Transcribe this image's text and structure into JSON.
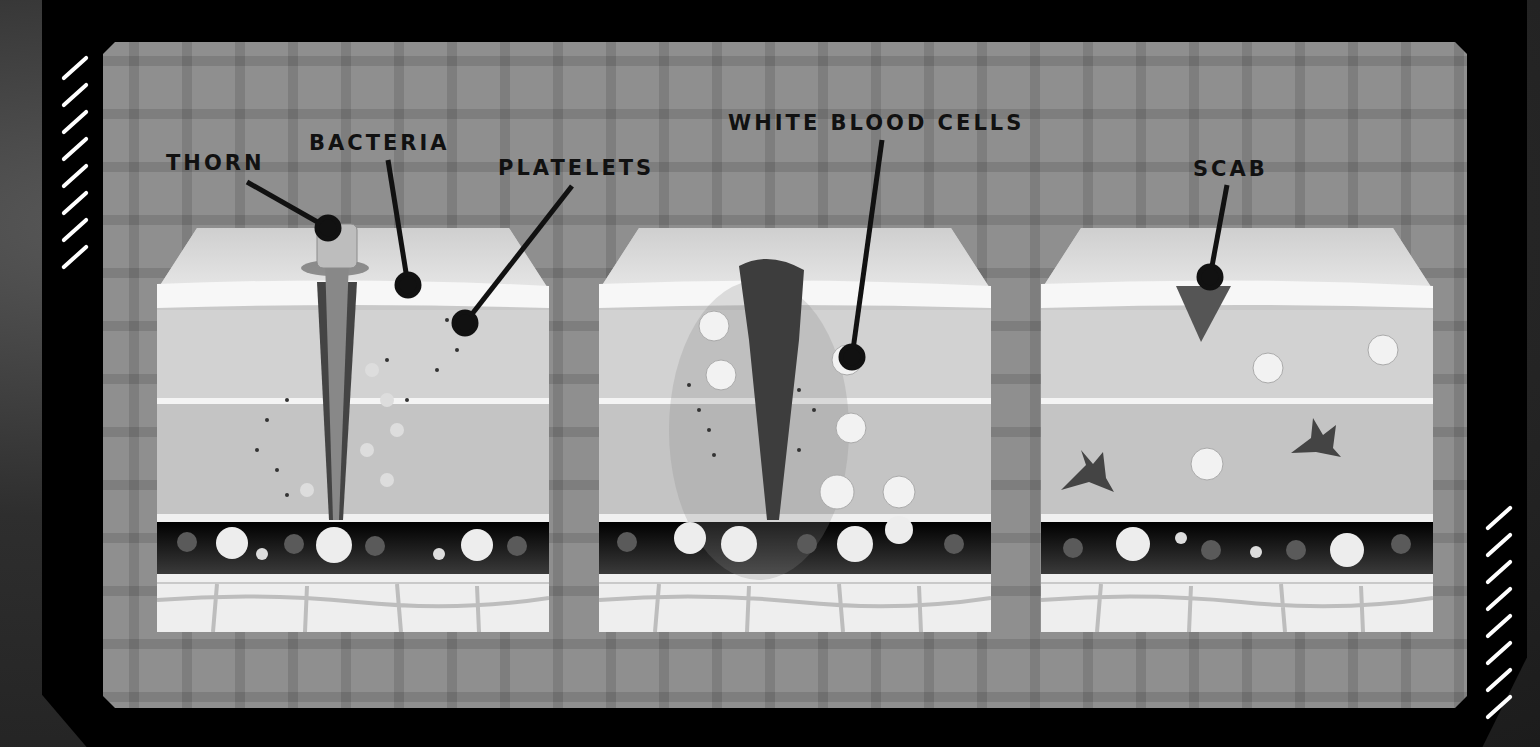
{
  "diagram": {
    "topic": "Wound healing stages",
    "labels": {
      "thorn": "THORN",
      "bacteria": "BACTERIA",
      "platelets": "PLATELETS",
      "white_blood_cells": "WHITE BLOOD CELLS",
      "scab": "SCAB"
    },
    "panels": [
      {
        "id": "stage-1",
        "description": "Thorn pierces skin, bacteria enter, platelets gather",
        "labels": [
          "THORN",
          "BACTERIA",
          "PLATELETS"
        ]
      },
      {
        "id": "stage-2",
        "description": "Clot forms, white blood cells leave blood vessel to fight bacteria",
        "labels": [
          "WHITE BLOOD CELLS"
        ]
      },
      {
        "id": "stage-3",
        "description": "Scab forms over healed tissue",
        "labels": [
          "SCAB"
        ]
      }
    ],
    "colors": {
      "frame": "#000000",
      "panel": "#8f8f8f",
      "skin_top": "#d9d9d9",
      "dermis": "#c8c8c8",
      "vessel": "#111111",
      "fat": "#eeeeee",
      "label": "#111111"
    }
  }
}
